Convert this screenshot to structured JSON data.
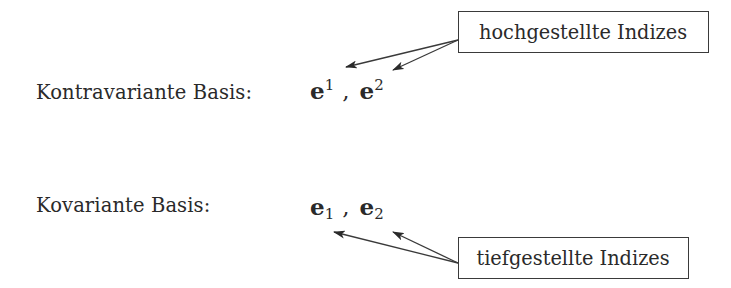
{
  "diagram": {
    "rows": [
      {
        "label": "Kontravariante Basis:",
        "symbol": "e",
        "indices": [
          "1",
          "2"
        ],
        "index_position": "superscript",
        "separator": ","
      },
      {
        "label": "Kovariante Basis:",
        "symbol": "e",
        "indices": [
          "1",
          "2"
        ],
        "index_position": "subscript",
        "separator": ","
      }
    ],
    "annotations": [
      {
        "text": "hochgestellte Indizes",
        "points_to": [
          "e^1",
          "e^2"
        ]
      },
      {
        "text": "tiefgestellte Indizes",
        "points_to": [
          "e_1",
          "e_2"
        ]
      }
    ],
    "colors": {
      "text": "#2a2a2a",
      "lines": "#3a3a3a",
      "background": "#ffffff"
    }
  }
}
